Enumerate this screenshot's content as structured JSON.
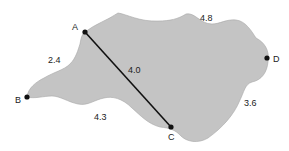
{
  "diagram": {
    "colors": {
      "region_fill": "#c4c4c4",
      "region_stroke": "#9a9a9a",
      "line": "#111111",
      "point": "#111111",
      "text": "#222222"
    },
    "points": [
      {
        "id": "A",
        "label": "A",
        "x": 85,
        "y": 32
      },
      {
        "id": "B",
        "label": "B",
        "x": 27,
        "y": 97
      },
      {
        "id": "C",
        "label": "C",
        "x": 171,
        "y": 127
      },
      {
        "id": "D",
        "label": "D",
        "x": 267,
        "y": 58
      }
    ],
    "segments": [
      {
        "from": "A",
        "to": "C",
        "label": "4.0"
      }
    ],
    "distance_labels": {
      "ab": "2.4",
      "ac": "4.0",
      "top": "4.8",
      "cd": "3.6",
      "bc": "4.3"
    }
  }
}
